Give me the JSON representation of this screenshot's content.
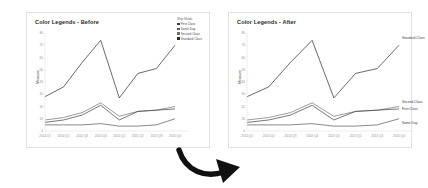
{
  "page": {
    "background": "#ffffff",
    "card_border": "#e2e2e2"
  },
  "charts": [
    {
      "id": "before",
      "title": "Color Legends - Before",
      "legend_mode": "legend-box",
      "legend": {
        "title": "Ship Mode",
        "entries": [
          {
            "label": "First Class",
            "color": "#3d3d3d"
          },
          {
            "label": "Same Day",
            "color": "#565656"
          },
          {
            "label": "Second Class",
            "color": "#707070"
          },
          {
            "label": "Standard Class",
            "color": "#2a2a2a"
          }
        ]
      }
    },
    {
      "id": "after",
      "title": "Color Legends - After",
      "legend_mode": "direct-labels",
      "direct_labels": [
        {
          "label": "Standard Class",
          "color": "#3a3a3a"
        },
        {
          "label": "Second Class",
          "color": "#3a3a3a"
        },
        {
          "label": "First Class",
          "color": "#3a3a3a"
        },
        {
          "label": "Same Day",
          "color": "#3a3a3a"
        }
      ]
    }
  ],
  "arrow": {
    "name": "curved-down-right-arrow",
    "color": "#111111"
  },
  "chart_data": {
    "type": "line",
    "title": "Color Legends",
    "xlabel": "",
    "ylabel": "Measure",
    "grid": false,
    "legend_position": "right",
    "categories": [
      "2014 Q1",
      "2014 Q2",
      "2014 Q3",
      "2014 Q4",
      "2015 Q1",
      "2015 Q2",
      "2015 Q3",
      "2015 Q4"
    ],
    "ylim": [
      0,
      80
    ],
    "yticks": [
      0,
      10,
      20,
      30,
      40,
      50,
      60,
      70,
      80
    ],
    "series": [
      {
        "name": "Standard Class",
        "color": "#2a2a2a",
        "values": [
          28,
          36,
          56,
          74,
          27,
          47,
          51,
          70
        ]
      },
      {
        "name": "Second Class",
        "color": "#707070",
        "values": [
          9,
          11,
          15,
          23,
          12,
          16,
          17,
          20
        ]
      },
      {
        "name": "First Class",
        "color": "#3d3d3d",
        "values": [
          7,
          9,
          13,
          21,
          9,
          16,
          17,
          18
        ]
      },
      {
        "name": "Same Day",
        "color": "#565656",
        "values": [
          5,
          5,
          5,
          6,
          4,
          4,
          5,
          10
        ]
      }
    ]
  }
}
